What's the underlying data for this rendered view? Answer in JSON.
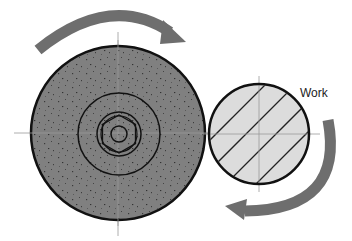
{
  "labels": {
    "work": "Work"
  },
  "colors": {
    "wheel_fill": "#808080",
    "work_fill": "#dcdcdc",
    "arrow_fill": "#6e6e6e",
    "outline": "#111111",
    "centerline": "#9a9a9a"
  },
  "wheel": {
    "center": [
      118,
      133
    ],
    "radius": 87,
    "inner_ring_radius": 41,
    "hex_radius": 22,
    "bore_radius": 8,
    "rotation": "clockwise"
  },
  "work": {
    "center": [
      259,
      134
    ],
    "radius": 50,
    "rotation": "clockwise"
  }
}
